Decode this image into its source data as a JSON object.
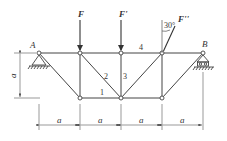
{
  "diagram": {
    "type": "plane truss",
    "supports": [
      {
        "label": "A",
        "type": "pin"
      },
      {
        "label": "B",
        "type": "roller"
      }
    ],
    "forces": [
      {
        "label": "F",
        "direction": "downward vertical"
      },
      {
        "label": "F'",
        "direction": "downward vertical"
      },
      {
        "label": "F''",
        "direction": "inclined",
        "angle_label": "30°"
      }
    ],
    "member_labels": [
      "1",
      "2",
      "3",
      "4"
    ],
    "dimensions": {
      "horizontal": [
        "a",
        "a",
        "a",
        "a"
      ],
      "vertical": "a"
    }
  },
  "labels": {
    "A": "A",
    "B": "B",
    "F": "F",
    "F1": "F'",
    "F2": "F''",
    "angle": "30°",
    "m1": "1",
    "m2": "2",
    "m3": "3",
    "m4": "4",
    "a": "a"
  }
}
